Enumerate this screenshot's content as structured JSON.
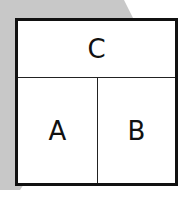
{
  "diagram": {
    "top_cell": {
      "label": "C"
    },
    "bottom_left_cell": {
      "label": "A"
    },
    "bottom_right_cell": {
      "label": "B"
    },
    "colors": {
      "background_shape": "#c8c8c8",
      "border": "#111111",
      "fill": "#ffffff"
    }
  }
}
